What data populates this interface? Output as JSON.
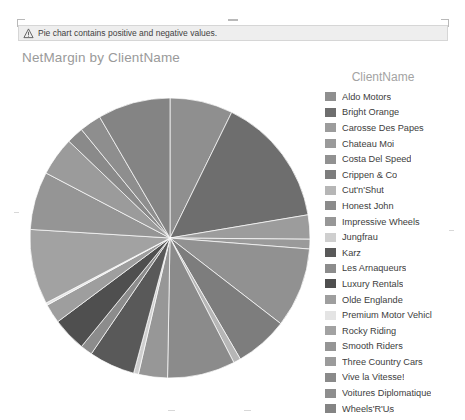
{
  "warning": {
    "icon": "warning-triangle-icon",
    "text": "Pie chart contains positive and negative values."
  },
  "chart_title": "NetMargin by ClientName",
  "legend": {
    "title": "ClientName",
    "items": [
      {
        "label": "Aldo Motors",
        "color": "#8f8f8f"
      },
      {
        "label": "Bright Orange",
        "color": "#6e6e6e"
      },
      {
        "label": "Carosse Des Papes",
        "color": "#9c9c9c"
      },
      {
        "label": "Chateau Moi",
        "color": "#9a9a9a"
      },
      {
        "label": "Costa Del Speed",
        "color": "#919191"
      },
      {
        "label": "Crippen & Co",
        "color": "#7d7d7d"
      },
      {
        "label": "Cut'n'Shut",
        "color": "#b6b6b6"
      },
      {
        "label": "Honest John",
        "color": "#8b8b8b"
      },
      {
        "label": "Impressive Wheels",
        "color": "#979797"
      },
      {
        "label": "Jungfrau",
        "color": "#cfcfcf"
      },
      {
        "label": "Karz",
        "color": "#595959"
      },
      {
        "label": "Les Arnaqueurs",
        "color": "#8c8c8c"
      },
      {
        "label": "Luxury Rentals",
        "color": "#4f4f4f"
      },
      {
        "label": "Olde Englande",
        "color": "#9e9e9e"
      },
      {
        "label": "Premium Motor Vehicl",
        "color": "#e4e4e4"
      },
      {
        "label": "Rocky Riding",
        "color": "#a2a2a2"
      },
      {
        "label": "Smooth Riders",
        "color": "#959595"
      },
      {
        "label": "Three Country Cars",
        "color": "#9b9b9b"
      },
      {
        "label": "Vive la Vitesse!",
        "color": "#8a8a8a"
      },
      {
        "label": "Voitures Diplomatique",
        "color": "#8e8e8e"
      },
      {
        "label": "Wheels'R'Us",
        "color": "#848484"
      }
    ]
  },
  "chart_data": {
    "type": "pie",
    "title": "NetMargin by ClientName",
    "legend_title": "ClientName",
    "legend_position": "right",
    "start_angle_deg": -90,
    "direction": "clockwise",
    "center": [
      140,
      140
    ],
    "radius": 140,
    "categories": [
      "Aldo Motors",
      "Bright Orange",
      "Carosse Des Papes",
      "Chateau Moi",
      "Costa Del Speed",
      "Crippen & Co",
      "Cut'n'Shut",
      "Honest John",
      "Impressive Wheels",
      "Jungfrau",
      "Karz",
      "Les Arnaqueurs",
      "Luxury Rentals",
      "Olde Englande",
      "Premium Motor Vehicl",
      "Rocky Riding",
      "Smooth Riders",
      "Three Country Cars",
      "Vive la Vitesse!",
      "Voitures Diplomatique",
      "Wheels'R'Us"
    ],
    "values": [
      26,
      54,
      10,
      4,
      33,
      22,
      3,
      28,
      12,
      2,
      19,
      5,
      14,
      8,
      1,
      31,
      24,
      16,
      7,
      9,
      30
    ],
    "angles_deg": [
      26,
      54,
      10,
      4,
      33,
      22,
      3,
      28,
      12,
      2,
      19,
      5,
      14,
      8,
      1,
      31,
      24,
      16,
      7,
      9,
      30
    ],
    "colors": [
      "#8f8f8f",
      "#6e6e6e",
      "#9c9c9c",
      "#9a9a9a",
      "#919191",
      "#7d7d7d",
      "#b6b6b6",
      "#8b8b8b",
      "#979797",
      "#cfcfcf",
      "#595959",
      "#8c8c8c",
      "#4f4f4f",
      "#9e9e9e",
      "#e4e4e4",
      "#a2a2a2",
      "#959595",
      "#9b9b9b",
      "#8a8a8a",
      "#8e8e8e",
      "#848484"
    ]
  }
}
